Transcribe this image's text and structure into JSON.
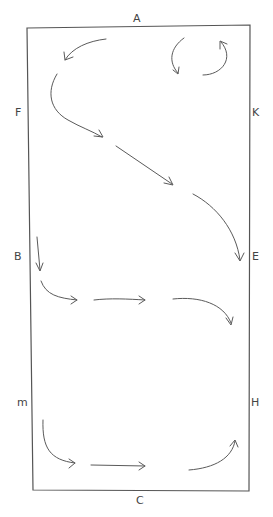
{
  "diagram": {
    "title": "",
    "markers": {
      "A": "A",
      "C": "C",
      "F": "F",
      "K": "K",
      "B": "B",
      "E": "E",
      "M": "M",
      "H": "H"
    },
    "marker_display": {
      "A": "A",
      "C": "C",
      "F": "F",
      "K": "K",
      "B": "B",
      "E": "E",
      "M": "m",
      "H": "H"
    },
    "stroke_color": "#5a5a5a",
    "arena_color": "#555555",
    "label_color": "#444444",
    "movements": [
      {
        "name": "circle-near-k",
        "from": "K",
        "description": "small circle near K"
      },
      {
        "name": "turn-toward-a",
        "from": "top",
        "description": "curve toward left after A"
      },
      {
        "name": "diagonal-f-to-e",
        "from": "F",
        "to": "E",
        "description": "diagonal across arena"
      },
      {
        "name": "b-across-to-e",
        "from": "B",
        "to": "E",
        "description": "straight across from B curving down"
      },
      {
        "name": "m-across-to-h",
        "from": "M",
        "to": "H",
        "description": "straight across from M curving up to H"
      }
    ]
  }
}
